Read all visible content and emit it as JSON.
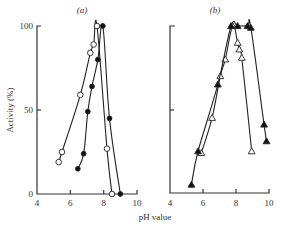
{
  "chart_data": [
    {
      "panel": "(a)",
      "type": "line",
      "title": "(a)",
      "xlabel": "",
      "ylabel": "Activity (%)",
      "xlim": [
        4,
        10
      ],
      "ylim": [
        0,
        100
      ],
      "xticks": [
        "4",
        "6",
        "8",
        "10"
      ],
      "yticks": [
        "0",
        "50",
        "100"
      ],
      "grid": false,
      "series": [
        {
          "name": "open circles",
          "marker": "open-circle",
          "points": [
            [
              5.3,
              19
            ],
            [
              5.5,
              25
            ],
            [
              6.6,
              59
            ],
            [
              7.2,
              84
            ],
            [
              7.4,
              89
            ],
            [
              7.6,
              100
            ],
            [
              8.2,
              27
            ],
            [
              8.5,
              0
            ]
          ]
        },
        {
          "name": "filled circles",
          "marker": "filled-circle",
          "points": [
            [
              6.45,
              15
            ],
            [
              6.8,
              24
            ],
            [
              7.05,
              49
            ],
            [
              7.3,
              64
            ],
            [
              7.65,
              80
            ],
            [
              7.95,
              100
            ],
            [
              8.35,
              45
            ],
            [
              9.0,
              0
            ]
          ]
        }
      ]
    },
    {
      "panel": "(b)",
      "type": "line",
      "title": "(b)",
      "xlabel": "pH value",
      "ylabel": "",
      "xlim": [
        4,
        10
      ],
      "ylim": [
        0,
        100
      ],
      "xticks": [
        "4",
        "6",
        "8",
        "10"
      ],
      "yticks": [],
      "grid": false,
      "series": [
        {
          "name": "open triangles",
          "marker": "open-triangle",
          "points": [
            [
              5.9,
              24
            ],
            [
              6.55,
              45
            ],
            [
              7.05,
              70
            ],
            [
              7.35,
              80
            ],
            [
              7.8,
              100
            ],
            [
              8.1,
              90
            ],
            [
              8.2,
              86
            ],
            [
              8.35,
              81
            ],
            [
              8.95,
              25
            ]
          ]
        },
        {
          "name": "filled triangles",
          "marker": "filled-triangle",
          "points": [
            [
              5.3,
              5
            ],
            [
              5.7,
              25
            ],
            [
              6.9,
              65
            ],
            [
              7.7,
              100
            ],
            [
              8.1,
              100
            ],
            [
              8.7,
              100
            ],
            [
              8.9,
              99
            ],
            [
              9.7,
              41
            ],
            [
              9.85,
              31
            ]
          ]
        }
      ]
    }
  ],
  "labels": {
    "panel_a": "(a)",
    "panel_b": "(b)",
    "y_axis": "Activity (%)",
    "x_axis": "pH value",
    "a_y_100": "100",
    "a_y_50": "50",
    "a_y_0": "0",
    "a_x_4": "4",
    "a_x_6": "6",
    "a_x_8": "8",
    "a_x_10": "10",
    "b_x_4": "4",
    "b_x_6": "6",
    "b_x_8": "8",
    "b_x_10": "10"
  }
}
